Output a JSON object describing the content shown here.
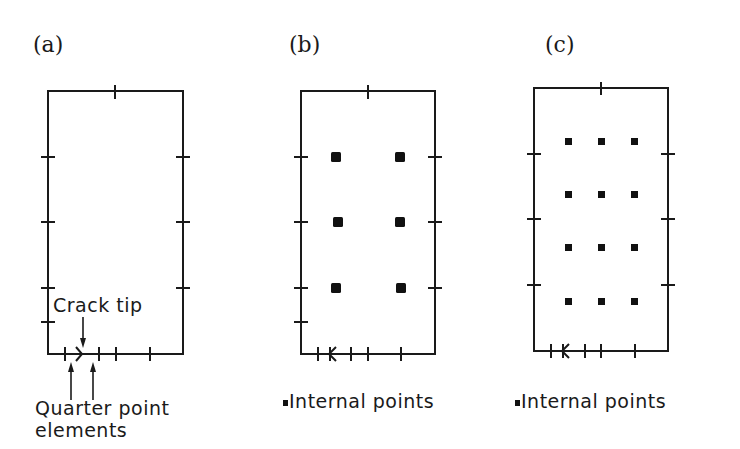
{
  "figure": {
    "panels": [
      {
        "id": "a",
        "label": "(a)",
        "annotations": {
          "crack_tip": "Crack tip",
          "quarter_point_line1": "Quarter point",
          "quarter_point_line2": "elements"
        },
        "internal_points_grid": null
      },
      {
        "id": "b",
        "label": "(b)",
        "legend": {
          "marker": "■",
          "text": "Internal points"
        },
        "internal_points_grid": {
          "columns": 2,
          "rows": 3
        }
      },
      {
        "id": "c",
        "label": "(c)",
        "legend": {
          "marker": "■",
          "text": "Internal points"
        },
        "internal_points_grid": {
          "columns": 3,
          "rows": 4
        }
      }
    ],
    "colors": {
      "ink": "#1a1a1a",
      "background": "#ffffff"
    }
  }
}
